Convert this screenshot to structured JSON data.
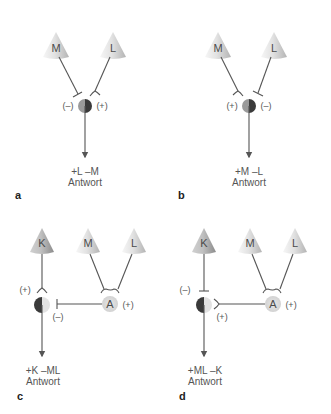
{
  "figure": {
    "colors": {
      "line": "#555555",
      "cone_light": "#f4f4f4",
      "cone_mid": "#d8d8d8",
      "cone_dark": "#a8a8a8",
      "cell_dark": "#3a3a3a",
      "cell_mid": "#9a9a9a",
      "cell_light": "#e2e2e2",
      "amacrine": "#dedede"
    },
    "panels": [
      {
        "id": "a",
        "letter": "a",
        "cones": [
          {
            "label": "M"
          },
          {
            "label": "L"
          }
        ],
        "signs": {
          "left": "(–)",
          "right": "(+)"
        },
        "response_line1": "+L –M",
        "response_line2": "Antwort"
      },
      {
        "id": "b",
        "letter": "b",
        "cones": [
          {
            "label": "M"
          },
          {
            "label": "L"
          }
        ],
        "signs": {
          "left": "(+)",
          "right": "(–)"
        },
        "response_line1": "+M –L",
        "response_line2": "Antwort"
      },
      {
        "id": "c",
        "letter": "c",
        "cones": [
          {
            "label": "K"
          },
          {
            "label": "M"
          },
          {
            "label": "L"
          }
        ],
        "amacrine_label": "A",
        "signs": {
          "k_input": "(+)",
          "a_input": "(–)",
          "a_output": "(+)"
        },
        "response_line1": "+K –ML",
        "response_line2": "Antwort"
      },
      {
        "id": "d",
        "letter": "d",
        "cones": [
          {
            "label": "K"
          },
          {
            "label": "M"
          },
          {
            "label": "L"
          }
        ],
        "amacrine_label": "A",
        "signs": {
          "k_input": "(–)",
          "a_input": "(+)",
          "a_output": "(+)"
        },
        "response_line1": "+ML –K",
        "response_line2": "Antwort"
      }
    ]
  }
}
